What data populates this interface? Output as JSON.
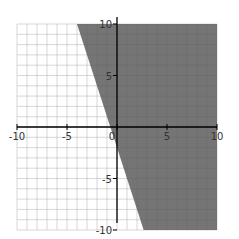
{
  "chart_data": {
    "type": "area",
    "title": "",
    "boundary_line": {
      "slope": -3,
      "intercept": -2,
      "style": "solid"
    },
    "shaded_region": "right/above line",
    "xlim": [
      -10,
      10
    ],
    "ylim": [
      -10,
      10
    ],
    "x_ticks": [
      "-10",
      "-5",
      "0",
      "5",
      "10"
    ],
    "y_ticks": [
      "10",
      "5",
      "-5",
      "-10"
    ],
    "grid": true,
    "colors": {
      "shade": "#6e6e6e",
      "grid": "#cccccc",
      "axis": "#000000"
    }
  }
}
